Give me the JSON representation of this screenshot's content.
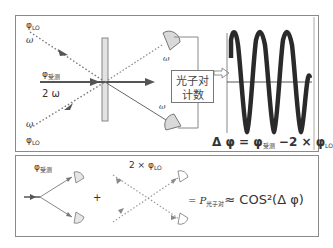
{
  "top_panel": {
    "labels": {
      "phi_lo_top": "φ",
      "phi_lo_top_sub": "LO",
      "omega_top": "ω",
      "phi_signal": "φ",
      "phi_signal_sub": "受测",
      "two_omega": "2 ω",
      "omega_bottom": "ω",
      "phi_lo_bottom": "φ",
      "phi_lo_bottom_sub": "LO",
      "omega_out_top": "ω",
      "omega_out_bottom": "ω"
    },
    "counter_box": {
      "line1": "光子对",
      "line2": "计数"
    },
    "formula": {
      "delta_phi": "Δ φ = φ",
      "signal_sub": "受测",
      "minus_term": " −2 × φ",
      "lo_sub": "LO"
    }
  },
  "bottom_panel": {
    "phi_signal": "φ",
    "phi_signal_sub": "受测",
    "plus": "+",
    "two_phi_lo": "2 × φ",
    "two_phi_lo_sub": "LO",
    "equals_p": "= P",
    "p_sub": "光子对",
    "approx_cos": "≈ COS²(Δ φ)"
  },
  "colors": {
    "line_dark": "#555555",
    "dotted": "#888888",
    "detector_fill": "#d9d9d9",
    "wave": "#2a2a2a",
    "border": "#8a8a8a"
  }
}
